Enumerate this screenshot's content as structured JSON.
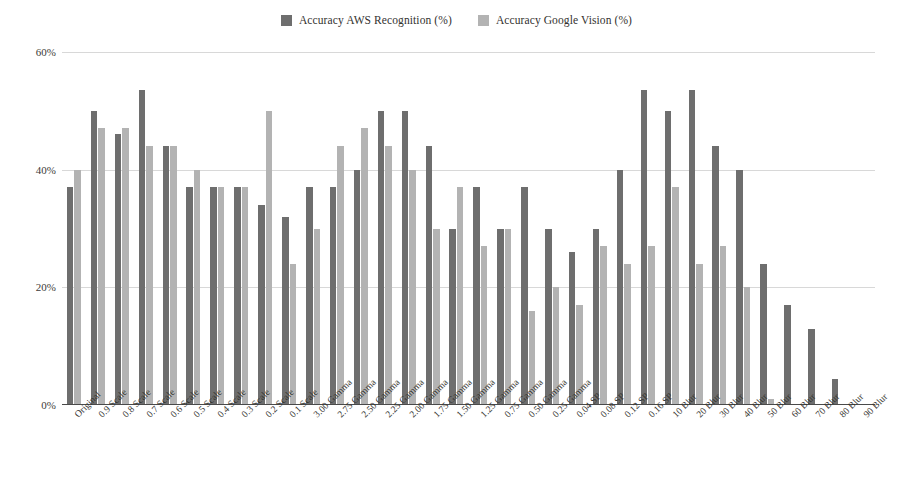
{
  "chart_data": {
    "type": "bar",
    "title": "",
    "xlabel": "",
    "ylabel": "",
    "ylim": [
      0,
      60
    ],
    "yticks": [
      0,
      20,
      40,
      60
    ],
    "ytick_labels": [
      "0%",
      "20%",
      "40%",
      "60%"
    ],
    "grid": true,
    "legend_position": "top-center",
    "categories": [
      "Original",
      "0.9 Scale",
      "0.8 Scale",
      "0.7 Scale",
      "0.6 Scale",
      "0.5 Scale",
      "0.4 Scale",
      "0.3 Scale",
      "0.2 Scale",
      "0.1 Scale",
      "3.00 Gamma",
      "2.75 Gamma",
      "2.50 Gamma",
      "2.25 Gamma",
      "2.00 Gamma",
      "1.75 Gamma",
      "1.50 Gamma",
      "1.25 Gamma",
      "0.75 Gamma",
      "0.50 Gamma",
      "0.25 Gamma",
      "0.04 SP",
      "0.08 SP",
      "0.12 SP",
      "0.16 SP",
      "10 Blur",
      "20 Blur",
      "30 Blur",
      "40 Blur",
      "50 Blur",
      "60 Blur",
      "70 Blur",
      "80 Blur",
      "90 Blur"
    ],
    "series": [
      {
        "name": "Accuracy AWS Recognition (%)",
        "color": "#6e6e6e",
        "values": [
          37,
          50,
          46,
          53.5,
          44,
          37,
          37,
          37,
          34,
          32,
          37,
          37,
          40,
          50,
          50,
          44,
          30,
          37,
          30,
          37,
          30,
          26,
          30,
          40,
          53.5,
          50,
          53.5,
          44,
          40,
          24,
          17,
          13,
          4.5,
          0
        ]
      },
      {
        "name": "Accuracy Google Vision (%)",
        "color": "#b3b3b3",
        "values": [
          40,
          47,
          47,
          44,
          44,
          40,
          37,
          37,
          50,
          24,
          30,
          44,
          47,
          44,
          40,
          30,
          37,
          27,
          30,
          16,
          20,
          17,
          27,
          24,
          27,
          37,
          24,
          27,
          20,
          1,
          0,
          0,
          0,
          0
        ]
      }
    ]
  },
  "legend": {
    "items": [
      {
        "label": "Accuracy AWS Recognition (%)",
        "color": "#6e6e6e"
      },
      {
        "label": "Accuracy Google Vision (%)",
        "color": "#b3b3b3"
      }
    ]
  }
}
